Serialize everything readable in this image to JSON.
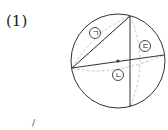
{
  "problem": {
    "number_label": "(1)"
  },
  "figure": {
    "type": "sphere-cross-sections",
    "circle": {
      "cx": 118,
      "cy": 61,
      "r": 47
    },
    "center_dot": {
      "x": 118,
      "y": 61
    },
    "lines": [
      {
        "name": "chord-left-to-top",
        "x1": 72,
        "y1": 68,
        "x2": 130,
        "y2": 16
      },
      {
        "name": "vertical-chord",
        "x1": 130,
        "y1": 16,
        "x2": 130,
        "y2": 107
      },
      {
        "name": "diameter-horizontal",
        "x1": 72,
        "y1": 68,
        "x2": 164,
        "y2": 55
      }
    ],
    "labels": [
      {
        "id": "giyeok",
        "text": "ㄱ",
        "x": 95,
        "y": 33
      },
      {
        "id": "nieun",
        "text": "ㄴ",
        "x": 118,
        "y": 75
      },
      {
        "id": "digeut",
        "text": "ㄷ",
        "x": 145,
        "y": 46
      }
    ],
    "colors": {
      "outline": "#333333",
      "dashed": "#c8c8c8",
      "dot": "#333333"
    }
  },
  "stray_mark": "/"
}
